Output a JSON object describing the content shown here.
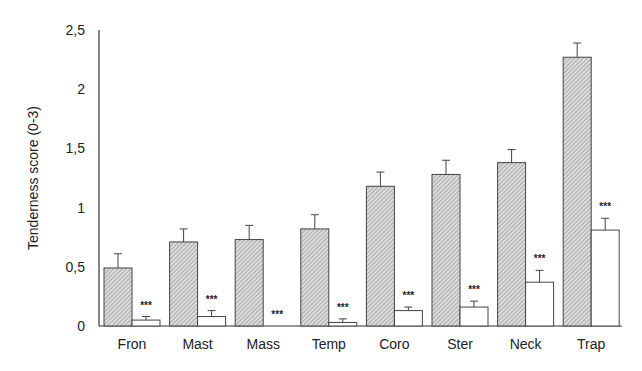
{
  "chart_data": {
    "type": "bar",
    "title": "",
    "xlabel": "",
    "ylabel": "Tenderness score (0-3)",
    "ylim": [
      0,
      2.5
    ],
    "yticks": [
      "0",
      "0,5",
      "1",
      "1,5",
      "2",
      "2,5"
    ],
    "grid": false,
    "legend": null,
    "categories": [
      "Fron",
      "Mast",
      "Mass",
      "Temp",
      "Coro",
      "Ster",
      "Neck",
      "Trap"
    ],
    "series": [
      {
        "name": "Group 1 (hatched)",
        "pattern": "hatched",
        "values": [
          0.49,
          0.71,
          0.73,
          0.82,
          1.18,
          1.28,
          1.38,
          2.27
        ],
        "errors": [
          0.12,
          0.11,
          0.12,
          0.12,
          0.12,
          0.12,
          0.11,
          0.12
        ]
      },
      {
        "name": "Group 2 (open)",
        "pattern": "open",
        "values": [
          0.05,
          0.08,
          0.0,
          0.03,
          0.13,
          0.16,
          0.37,
          0.81
        ],
        "errors": [
          0.03,
          0.05,
          0.0,
          0.03,
          0.03,
          0.05,
          0.1,
          0.1
        ]
      }
    ],
    "annotations": [
      "***",
      "***",
      "***",
      "***",
      "***",
      "***",
      "***",
      "***"
    ]
  },
  "colors": {
    "axis": "#333333",
    "hatch": "#777777",
    "hatch_bg": "#d9d9d9",
    "open_fill": "#ffffff"
  }
}
